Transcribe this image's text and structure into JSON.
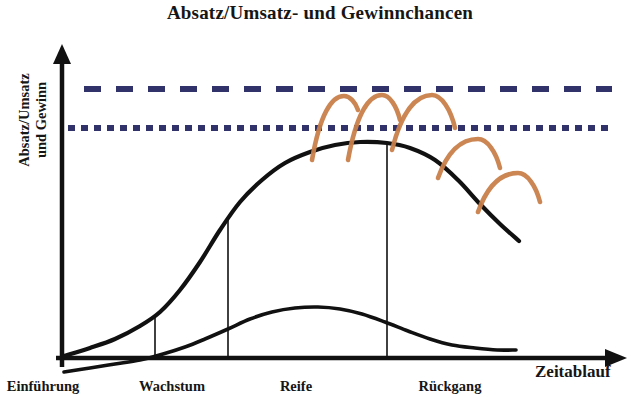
{
  "chart_data": {
    "type": "line",
    "title": "Absatz/Umsatz- und Gewinnchancen",
    "ylabel_line1": "Absatz/Umsatz",
    "ylabel_line2": "und Gewinn",
    "xlabel": "Zeitablauf",
    "grid": false,
    "legend_position": "none",
    "categories": [
      "Einführung",
      "Wachstum",
      "Reife",
      "Rückgang"
    ],
    "stage_boundaries_x": [
      155,
      228,
      387
    ],
    "axis": {
      "x_origin": 62,
      "y_origin": 358,
      "x_arrow_tip": 627,
      "y_arrow_tip": 44
    },
    "reference_lines": [
      {
        "name": "upper-threshold",
        "style": "long-dashed",
        "color": "#32326b",
        "y": 89,
        "x_start": 84,
        "x_end": 612
      },
      {
        "name": "lower-threshold",
        "style": "short-dashed",
        "color": "#32326b",
        "y": 128,
        "x_start": 68,
        "x_end": 612
      }
    ],
    "series": [
      {
        "name": "Absatz/Umsatz",
        "color": "#111111",
        "points": [
          [
            64,
            356
          ],
          [
            90,
            348
          ],
          [
            115,
            339
          ],
          [
            140,
            326
          ],
          [
            160,
            312
          ],
          [
            180,
            290
          ],
          [
            200,
            262
          ],
          [
            220,
            230
          ],
          [
            240,
            202
          ],
          [
            262,
            180
          ],
          [
            285,
            163
          ],
          [
            310,
            152
          ],
          [
            335,
            145
          ],
          [
            360,
            142
          ],
          [
            387,
            143
          ],
          [
            410,
            148
          ],
          [
            435,
            160
          ],
          [
            458,
            180
          ],
          [
            480,
            204
          ],
          [
            500,
            224
          ],
          [
            519,
            241
          ]
        ]
      },
      {
        "name": "Gewinn",
        "color": "#111111",
        "points": [
          [
            64,
            372
          ],
          [
            90,
            368
          ],
          [
            115,
            364
          ],
          [
            140,
            360
          ],
          [
            163,
            354
          ],
          [
            185,
            347
          ],
          [
            205,
            339
          ],
          [
            228,
            329
          ],
          [
            250,
            319
          ],
          [
            272,
            312
          ],
          [
            295,
            308
          ],
          [
            318,
            307
          ],
          [
            340,
            309
          ],
          [
            362,
            314
          ],
          [
            385,
            322
          ],
          [
            408,
            331
          ],
          [
            430,
            339
          ],
          [
            452,
            345
          ],
          [
            475,
            348
          ],
          [
            497,
            350
          ],
          [
            516,
            350
          ]
        ]
      }
    ],
    "opportunity_arcs": {
      "name": "Gewinnchancen",
      "color": "#c8804a",
      "count": 5,
      "arcs": [
        {
          "x_start": 312,
          "y_start": 160,
          "x_peak": 344,
          "y_peak": 96,
          "x_end": 358,
          "y_end": 110
        },
        {
          "x_start": 348,
          "y_start": 160,
          "x_peak": 382,
          "y_peak": 95,
          "x_end": 400,
          "y_end": 120
        },
        {
          "x_start": 392,
          "y_start": 150,
          "x_peak": 432,
          "y_peak": 95,
          "x_end": 455,
          "y_end": 128
        },
        {
          "x_start": 438,
          "y_start": 178,
          "x_peak": 478,
          "y_peak": 139,
          "x_end": 500,
          "y_end": 168
        },
        {
          "x_start": 478,
          "y_start": 212,
          "x_peak": 518,
          "y_peak": 173,
          "x_end": 540,
          "y_end": 202
        }
      ]
    }
  },
  "colors": {
    "curve": "#111111",
    "reference_line": "#32326b",
    "opportunity_arc": "#c8804a",
    "text": "#161616",
    "background": "#ffffff"
  }
}
